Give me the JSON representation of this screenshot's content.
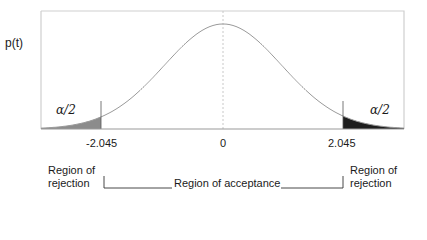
{
  "chart_data": {
    "type": "area",
    "title": "",
    "ylabel": "p(t)",
    "xlabel": "",
    "distribution": "t (two-tailed test)",
    "x_ticks": [
      "-2.045",
      "0",
      "2.045"
    ],
    "critical_values": [
      -2.045,
      2.045
    ],
    "center": 0,
    "tail_labels": [
      "α/2",
      "α/2"
    ],
    "regions": [
      {
        "name": "Region of rejection",
        "range": "t < -2.045",
        "color": "#8c8c8c"
      },
      {
        "name": "Region of acceptance",
        "range": "-2.045 ≤ t ≤ 2.045"
      },
      {
        "name": "Region of rejection",
        "range": "t > 2.045",
        "color": "#1e1e1e"
      }
    ],
    "grid": false,
    "legend": "none"
  },
  "labels": {
    "ylabel": "p(t)",
    "left_alpha": "α/2",
    "right_alpha": "α/2",
    "tick_left": "-2.045",
    "tick_center": "0",
    "tick_right": "2.045",
    "left_region_line1": "Region of",
    "left_region_line2": "rejection",
    "acceptance": "Region of acceptance",
    "right_region_line1": "Region of",
    "right_region_line2": "rejection"
  },
  "colors": {
    "left_tail": "#8c8c8c",
    "right_tail": "#1e1e1e",
    "curve": "#9a9a9a",
    "frame": "#c8c8c8"
  }
}
